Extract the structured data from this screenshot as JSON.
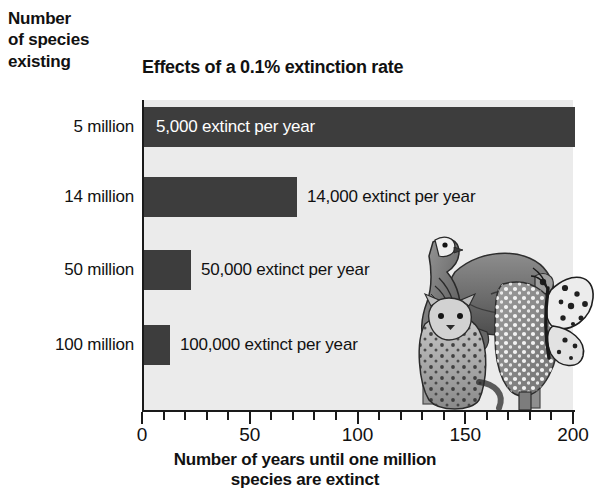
{
  "y_axis_heading": {
    "line1": "Number",
    "line2": "of species",
    "line3": "existing"
  },
  "chart_data": {
    "type": "bar",
    "orientation": "horizontal",
    "title": "Effects of a 0.1% extinction rate",
    "xlabel_line1": "Number of years until one million",
    "xlabel_line2": "species are extinct",
    "ylabel": "Number of species existing",
    "categories": [
      "5 million",
      "14 million",
      "50 million",
      "100 million"
    ],
    "values": [
      200,
      71,
      20,
      10
    ],
    "data_labels": [
      "5,000 extinct per year",
      "14,000 extinct per year",
      "50,000 extinct per year",
      "100,000 extinct per year"
    ],
    "label_placement": [
      "inside",
      "outside",
      "outside",
      "outside"
    ],
    "xlim": [
      0,
      200
    ],
    "xticks": [
      0,
      50,
      100,
      150,
      200
    ],
    "xtick_labels": [
      "0",
      "50",
      "100",
      "150",
      "200"
    ],
    "minor_tick_step": 10,
    "grid": false,
    "legend": null,
    "bar_color": "#3d3d3d",
    "plot_background": "#ebebeb",
    "page_background": "#ffffff"
  },
  "illustration": {
    "name": "endangered-species-collage",
    "animals": [
      "falcon",
      "tree-frog",
      "leopard",
      "spotted-plant",
      "butterfly"
    ]
  }
}
